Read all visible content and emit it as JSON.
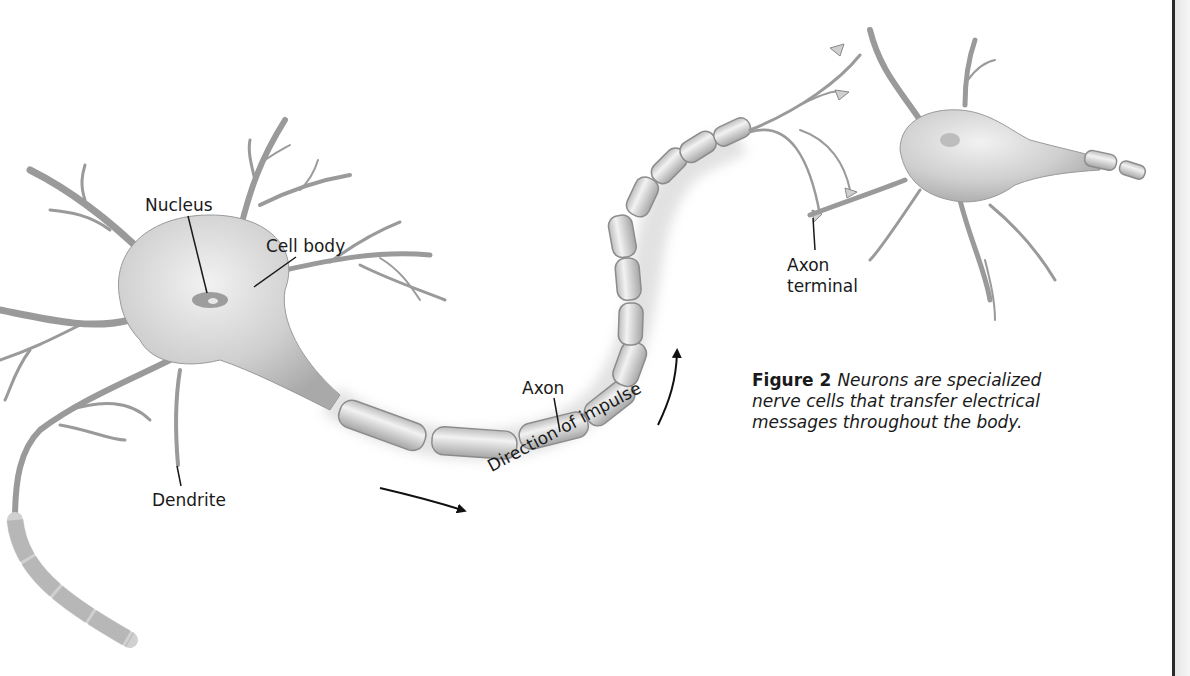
{
  "figure": {
    "number_label": "Figure 2",
    "caption": "Neurons are specialized nerve cells that transfer electrical messages throughout the body."
  },
  "labels": {
    "nucleus": "Nucleus",
    "cell_body": "Cell body",
    "dendrite": "Dendrite",
    "axon": "Axon",
    "axon_terminal_line1": "Axon",
    "axon_terminal_line2": "terminal",
    "direction": "Direction of impulse"
  },
  "colors": {
    "ink": "#1a1a1a",
    "neuron_fill": "#d9d9d9",
    "neuron_shade": "#a8a8a8",
    "myelin": "#e4e4e4"
  }
}
